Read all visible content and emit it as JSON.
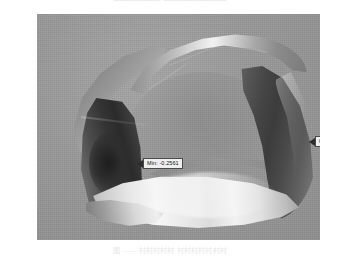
{
  "page": {
    "header_text": "——————  ————————",
    "caption_text": "图  ——  村村村村村  村村村村村村村"
  },
  "figure": {
    "background_color": "#9b9b9b",
    "surface_name": "twisted-closed-band-surface",
    "annotations": [
      {
        "id": "min",
        "label": "Min: -0.2561",
        "arrow": "left",
        "x": 100,
        "y": 144
      },
      {
        "id": "max",
        "label": "0.0948",
        "arrow": "left",
        "x": 272,
        "y": 122
      }
    ]
  },
  "chart_data": {
    "type": "surface",
    "title": "",
    "xlabel": "",
    "ylabel": "",
    "zlabel": "",
    "colormap": "grayscale",
    "value_range": [
      -0.2561,
      0.0948
    ],
    "annotations": [
      {
        "label": "Min: -0.2561",
        "value": -0.2561,
        "location": "left-dark-face"
      },
      {
        "label": "0.0948",
        "value": 0.0948,
        "location": "right-dark-face"
      }
    ],
    "grid": false,
    "legend": "none"
  }
}
